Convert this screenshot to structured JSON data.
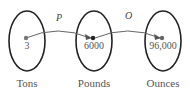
{
  "diagram": {
    "sets": [
      {
        "name": "Tons",
        "value": "3"
      },
      {
        "name": "Pounds",
        "value": "6000"
      },
      {
        "name": "Ounces",
        "value": "96,000"
      }
    ],
    "functions": [
      {
        "label": "P",
        "from": "Tons",
        "to": "Pounds"
      },
      {
        "label": "O",
        "from": "Pounds",
        "to": "Ounces"
      }
    ]
  }
}
